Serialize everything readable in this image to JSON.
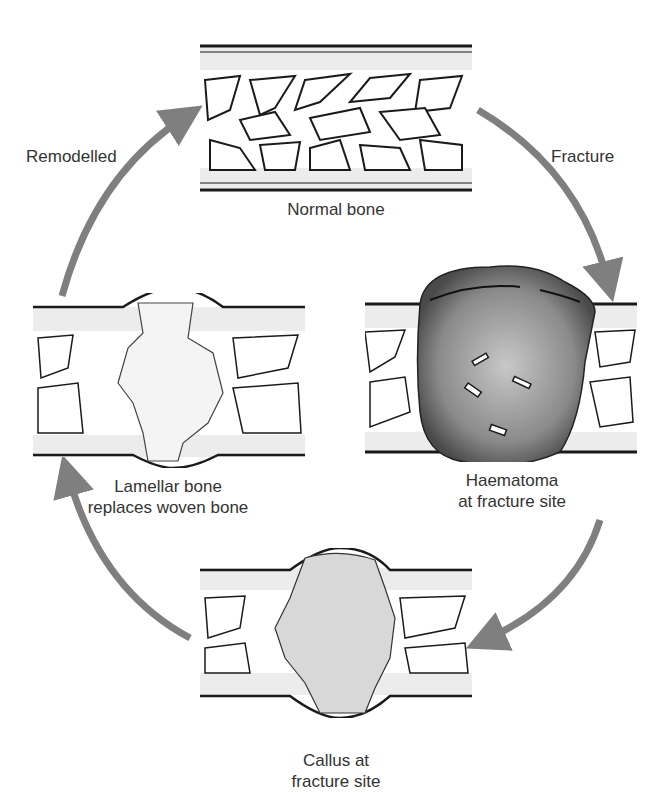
{
  "diagram": {
    "stages": [
      {
        "id": "normal",
        "label_lines": [
          "Normal bone"
        ]
      },
      {
        "id": "haematoma",
        "label_lines": [
          "Haematoma",
          "at fracture site"
        ]
      },
      {
        "id": "callus",
        "label_lines": [
          "Callus at",
          "fracture site"
        ]
      },
      {
        "id": "lamellar",
        "label_lines": [
          "Lamellar bone",
          "replaces woven bone"
        ]
      }
    ],
    "arrows": [
      {
        "from": "normal",
        "to": "haematoma",
        "label": "Fracture"
      },
      {
        "from": "haematoma",
        "to": "callus",
        "label": ""
      },
      {
        "from": "callus",
        "to": "lamellar",
        "label": ""
      },
      {
        "from": "lamellar",
        "to": "normal",
        "label": "Remodelled"
      }
    ],
    "colors": {
      "arrow": "#7f7f7f",
      "outline": "#1a1a1a",
      "cortex_fill": "#ececec",
      "haematoma": "#5a5a5a",
      "callus": "#d8d8d8"
    }
  }
}
